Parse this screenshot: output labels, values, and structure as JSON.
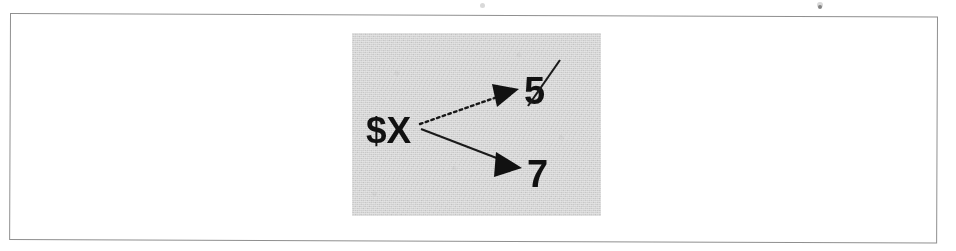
{
  "figure": {
    "caption": "",
    "panel_background": "#e4e4e4",
    "frame_color": "#8f8f8f",
    "ink_color": "#111111"
  },
  "diagram": {
    "type": "variable-reassignment",
    "variable": {
      "label": "$X",
      "x": 366,
      "y": 143
    },
    "edges": [
      {
        "id": "edge-to-5",
        "style": "dotted",
        "from_x": 420,
        "from_y": 124,
        "to_x": 519,
        "to_y": 89,
        "meaning": "old-reference-broken"
      },
      {
        "id": "edge-to-7",
        "style": "solid",
        "from_x": 421,
        "from_y": 129,
        "to_x": 522,
        "to_y": 168,
        "meaning": "current-reference"
      }
    ],
    "values": [
      {
        "id": "value-5",
        "label": "5",
        "x": 524,
        "y": 104,
        "struck_through": true,
        "strike": {
          "x1": 528,
          "y1": 106,
          "x2": 560,
          "y2": 60
        }
      },
      {
        "id": "value-7",
        "label": "7",
        "x": 527,
        "y": 187,
        "struck_through": false,
        "strike": null
      }
    ]
  },
  "artifacts": {
    "specks": [
      {
        "x": 480,
        "y": 3,
        "w": 5,
        "h": 5
      },
      {
        "x": 817,
        "y": 2,
        "w": 6,
        "h": 6
      },
      {
        "x": 818,
        "y": 5,
        "w": 4,
        "h": 4
      }
    ]
  }
}
